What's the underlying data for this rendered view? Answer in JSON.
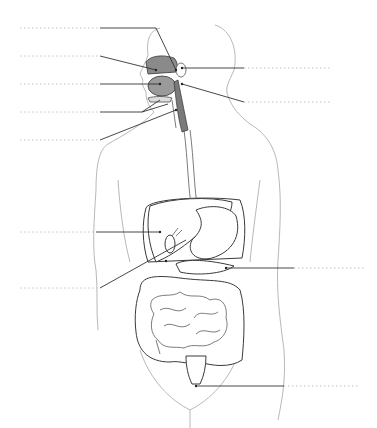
{
  "diagram": {
    "labels": [
      {
        "id": "label-1",
        "side": "left",
        "text": ""
      },
      {
        "id": "label-2",
        "side": "left",
        "text": ""
      },
      {
        "id": "label-3",
        "side": "left",
        "text": ""
      },
      {
        "id": "label-4",
        "side": "left",
        "text": ""
      },
      {
        "id": "label-5",
        "side": "left",
        "text": ""
      },
      {
        "id": "label-6",
        "side": "right",
        "text": ""
      },
      {
        "id": "label-7",
        "side": "right",
        "text": ""
      },
      {
        "id": "label-8",
        "side": "left",
        "text": ""
      },
      {
        "id": "label-9",
        "side": "left",
        "text": ""
      },
      {
        "id": "label-10",
        "side": "right",
        "text": ""
      },
      {
        "id": "label-11",
        "side": "right",
        "text": ""
      }
    ],
    "colors": {
      "body_outline": "#b8b8b8",
      "organ_stroke": "#3a3a3a",
      "mouth_fill": "#8a8a8a",
      "tongue_fill": "#9a9a9a",
      "esophagus_fill": "#7a7a7a",
      "blank_line": "#c4c4c4"
    }
  }
}
